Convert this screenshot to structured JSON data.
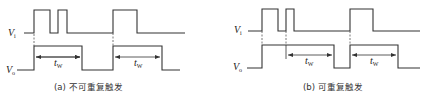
{
  "panels": [
    {
      "id": "a",
      "caption": "(a) 不可重复触发",
      "vi_label": "V",
      "vi_sub": "i",
      "vo_label": "V",
      "vo_sub": "o",
      "tw_labels": [
        "t",
        "t"
      ],
      "tw_sub": "W",
      "vi_points": "24,33 34,33 34,10 50,10 50,33 58,33 58,10 67,10 67,33 113,33 113,10 137,10 137,33 185,33",
      "vo_points": "17,70 34,70 34,46 82,46 82,70 113,70 113,46 162,46 162,70 180,70",
      "dashes": [
        [
          34,
          34,
          34,
          46
        ],
        [
          113,
          33,
          113,
          46
        ]
      ],
      "arrows": [
        {
          "x1": 34,
          "x2": 82,
          "y": 57,
          "label_x": 54
        },
        {
          "x1": 113,
          "x2": 162,
          "y": 57,
          "label_x": 134
        }
      ]
    },
    {
      "id": "b",
      "caption": "(b) 可重复触发",
      "vi_label": "V",
      "vi_sub": "i",
      "vo_label": "V",
      "vo_sub": "o",
      "tw_labels": [
        "t",
        "t"
      ],
      "tw_sub": "W",
      "vi_points": "248,31 262,31 262,9 278,9 278,31 286,31 286,9 294,9 294,31 350,31 350,9 373,9 373,31 420,31",
      "vo_points": "247,68 262,68 262,45 334,45 334,68 350,68 350,45 398,45 398,68 420,68",
      "dashes": [
        [
          262,
          31,
          262,
          45
        ],
        [
          286,
          31,
          286,
          45
        ],
        [
          350,
          31,
          350,
          45
        ]
      ],
      "arrows": [
        {
          "x1": 286,
          "x2": 334,
          "y": 55,
          "label_x": 305
        },
        {
          "x1": 350,
          "x2": 398,
          "y": 55,
          "label_x": 370
        }
      ]
    }
  ]
}
